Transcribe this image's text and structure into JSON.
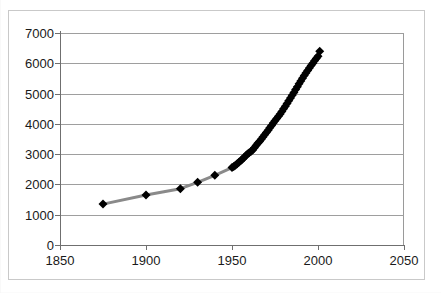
{
  "chart_data": {
    "type": "scatter",
    "title": "",
    "subtitle": "",
    "xlabel": "",
    "ylabel": "",
    "xlim": [
      1850,
      2050
    ],
    "ylim": [
      0,
      7000
    ],
    "xticks": [
      1850,
      1900,
      1950,
      2000,
      2050
    ],
    "yticks": [
      0,
      1000,
      2000,
      3000,
      4000,
      5000,
      6000,
      7000
    ],
    "xtick_labels": [
      "1850",
      "1900",
      "1950",
      "2000",
      "2050"
    ],
    "ytick_labels": [
      "0",
      "1000",
      "2000",
      "3000",
      "4000",
      "5000",
      "6000",
      "7000"
    ],
    "grid": "horizontal",
    "legend": "none",
    "marker": "diamond",
    "marker_color": "#000000",
    "marker_size": 9,
    "line_color": "#8a8a8a",
    "line_width": 3,
    "plot_background": "#ffffff",
    "axis_color": "#6f6f6f",
    "gridline_color": "#9e9e9e",
    "series": [
      {
        "name": "series-1",
        "x": [
          1875,
          1900,
          1920,
          1930,
          1940,
          1950,
          1951,
          1952,
          1953,
          1954,
          1955,
          1956,
          1957,
          1958,
          1959,
          1960,
          1961,
          1962,
          1963,
          1964,
          1965,
          1966,
          1967,
          1968,
          1969,
          1970,
          1971,
          1972,
          1973,
          1974,
          1975,
          1976,
          1977,
          1978,
          1979,
          1980,
          1981,
          1982,
          1983,
          1984,
          1985,
          1986,
          1987,
          1988,
          1989,
          1990,
          1991,
          1992,
          1993,
          1994,
          1995,
          1996,
          1997,
          1998,
          1999,
          2000,
          2001
        ],
        "y": [
          1350,
          1650,
          1860,
          2070,
          2300,
          2556,
          2594,
          2636,
          2682,
          2730,
          2781,
          2834,
          2890,
          2947,
          3001,
          3043,
          3084,
          3140,
          3210,
          3285,
          3356,
          3421,
          3490,
          3563,
          3638,
          3713,
          3792,
          3872,
          3949,
          4025,
          4100,
          4173,
          4249,
          4328,
          4410,
          4495,
          4582,
          4672,
          4762,
          4853,
          4943,
          5036,
          5131,
          5228,
          5324,
          5418,
          5509,
          5597,
          5682,
          5764,
          5844,
          5924,
          6003,
          6080,
          6156,
          6230,
          6400
        ]
      }
    ]
  },
  "axes": {
    "y_title": "",
    "x_title": ""
  }
}
